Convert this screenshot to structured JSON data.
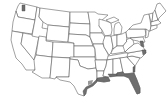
{
  "map": {
    "subject": "Map of the contiguous United States with state boundaries",
    "style": "outline map, white fill, gray borders",
    "colors": {
      "background": "#ffffff",
      "state_fill": "#ffffff",
      "state_border": "#555555",
      "highlight_fill": "#6e6e6e"
    },
    "highlighted_regions": [
      {
        "name": "Puget Sound, Washington",
        "shade": "dark"
      },
      {
        "name": "Texas Gulf Coast",
        "shade": "dark"
      },
      {
        "name": "Louisiana coast",
        "shade": "dark"
      },
      {
        "name": "Mississippi coast",
        "shade": "dark"
      },
      {
        "name": "Alabama coast",
        "shade": "dark"
      },
      {
        "name": "Florida",
        "shade": "dark"
      },
      {
        "name": "Georgia coast",
        "shade": "dark"
      },
      {
        "name": "Chesapeake Bay / Virginia coast",
        "shade": "dark"
      },
      {
        "name": "North Carolina coast",
        "shade": "dark"
      }
    ]
  }
}
